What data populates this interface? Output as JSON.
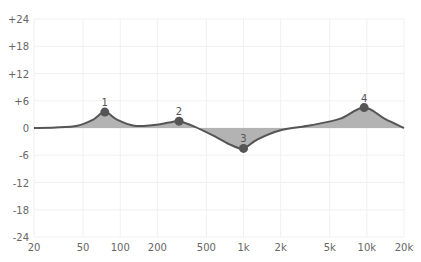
{
  "chart_data": {
    "type": "line",
    "title": "",
    "xlabel": "",
    "ylabel": "",
    "x_scale": "log",
    "xlim": [
      20,
      20000
    ],
    "ylim": [
      -24,
      24
    ],
    "grid": true,
    "legend": null,
    "x_ticks": [
      {
        "value": 20,
        "label": "20"
      },
      {
        "value": 50,
        "label": "50"
      },
      {
        "value": 100,
        "label": "100"
      },
      {
        "value": 200,
        "label": "200"
      },
      {
        "value": 500,
        "label": "500"
      },
      {
        "value": 1000,
        "label": "1k"
      },
      {
        "value": 2000,
        "label": "2k"
      },
      {
        "value": 5000,
        "label": "5k"
      },
      {
        "value": 10000,
        "label": "10k"
      },
      {
        "value": 20000,
        "label": "20k"
      }
    ],
    "y_ticks": [
      {
        "value": 24,
        "label": "+24"
      },
      {
        "value": 18,
        "label": "+18"
      },
      {
        "value": 12,
        "label": "+12"
      },
      {
        "value": 6,
        "label": "+6"
      },
      {
        "value": 0,
        "label": "0"
      },
      {
        "value": -6,
        "label": "-6"
      },
      {
        "value": -12,
        "label": "-12"
      },
      {
        "value": -18,
        "label": "-18"
      },
      {
        "value": -24,
        "label": "-24"
      }
    ],
    "bands": [
      {
        "label": "1",
        "freq": 75,
        "gain": 3.5
      },
      {
        "label": "2",
        "freq": 300,
        "gain": 1.5
      },
      {
        "label": "3",
        "freq": 1000,
        "gain": -4.5
      },
      {
        "label": "4",
        "freq": 9500,
        "gain": 4.5
      }
    ],
    "series": [
      {
        "name": "EQ response",
        "x": [
          20,
          30,
          45,
          60,
          75,
          95,
          130,
          180,
          250,
          300,
          400,
          600,
          800,
          1000,
          1300,
          2000,
          3500,
          6000,
          9500,
          14000,
          20000
        ],
        "values": [
          0,
          0.1,
          0.5,
          1.8,
          3.5,
          1.8,
          0.5,
          0.6,
          1.2,
          1.5,
          0.3,
          -2.0,
          -3.8,
          -4.5,
          -2.5,
          -0.5,
          0.6,
          2.0,
          4.5,
          2.0,
          0
        ]
      }
    ],
    "colors": {
      "line": "#555555",
      "fill": "#b3b3b3",
      "point": "#555555",
      "grid": "#f0f0f0"
    }
  }
}
